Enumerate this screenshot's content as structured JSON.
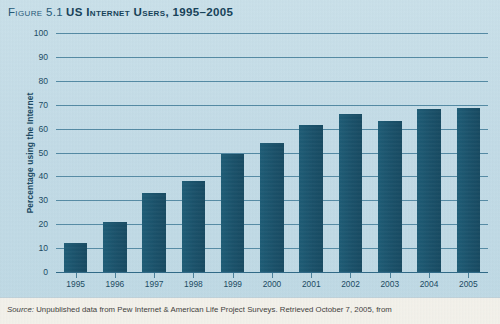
{
  "figure": {
    "number_label": "Figure 5.1",
    "title": "US Internet Users, 1995–2005"
  },
  "colors": {
    "background": "#c5dde7",
    "bar": "#19566f",
    "gridline": "#2e6d8c",
    "text": "#18485f",
    "footer_background": "#f3f1ea"
  },
  "source": {
    "prefix": "Source:",
    "text": "Unpublished data from Pew Internet & American Life Project Surveys. Retrieved October 7, 2005, from"
  },
  "chart_data": {
    "type": "bar",
    "title": "US Internet Users, 1995–2005",
    "xlabel": "",
    "ylabel": "Percentage using the Internet",
    "categories": [
      "1995",
      "1996",
      "1997",
      "1998",
      "1999",
      "2000",
      "2001",
      "2002",
      "2003",
      "2004",
      "2005"
    ],
    "values": [
      12,
      21,
      33,
      38,
      49.5,
      54,
      61.5,
      66,
      63,
      68,
      68.5
    ],
    "ylim": [
      0,
      100
    ],
    "yticks": [
      100,
      90,
      80,
      70,
      60,
      50,
      40,
      30,
      20,
      10,
      0
    ],
    "ytick_labels": [
      "100",
      "90",
      "80",
      "70",
      "60",
      "50",
      "40",
      "30",
      "20",
      "10",
      "0"
    ],
    "grid": true,
    "legend": false,
    "series": [
      {
        "name": "Percentage using the Internet",
        "values": [
          12,
          21,
          33,
          38,
          49.5,
          54,
          61.5,
          66,
          63,
          68,
          68.5
        ]
      }
    ]
  }
}
